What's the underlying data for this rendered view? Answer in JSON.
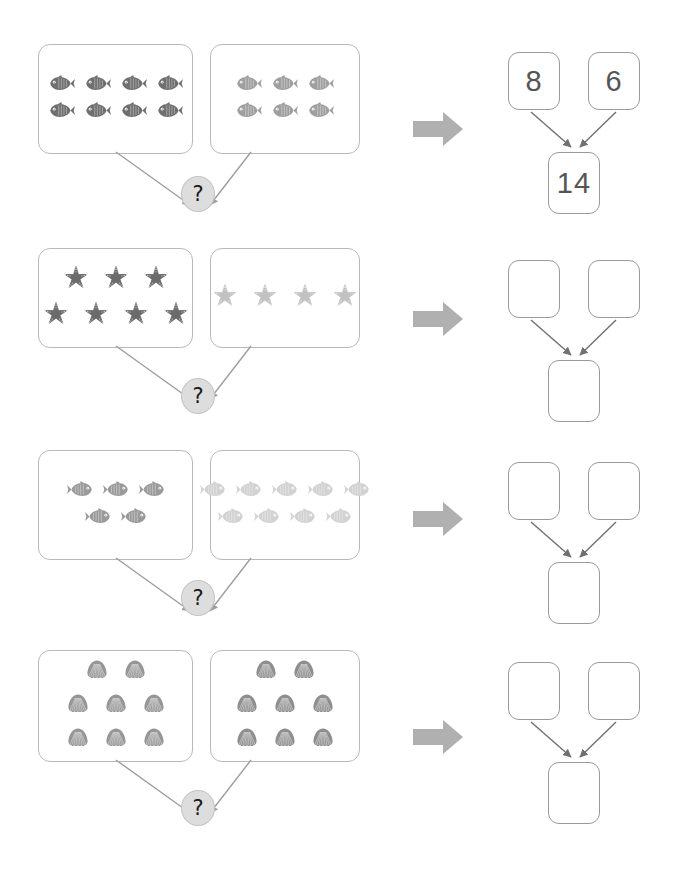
{
  "page": {
    "clipped_header_text": "· · ·· ·   ··  ·· ·  ·",
    "question_symbol": "?",
    "arrow_icon": "right-arrow-icon",
    "colors": {
      "box_border": "#b9b9b9",
      "bond_border": "#9a9a9a",
      "arrow_gray": "#a6a6a6",
      "qmark_fill": "#dddddd",
      "line_gray": "#9e9e9e"
    }
  },
  "rows": [
    {
      "id": "row-1",
      "left_group": {
        "icon": "fish-icon",
        "count": 8,
        "color": "#6f6f6f",
        "layout": [
          4,
          4
        ],
        "direction": "left"
      },
      "right_group": {
        "icon": "fish-icon",
        "count": 6,
        "color": "#9f9f9f",
        "layout": [
          3,
          3
        ],
        "direction": "left"
      },
      "bond": {
        "part_a": "8",
        "part_b": "6",
        "total": "14",
        "filled": true
      }
    },
    {
      "id": "row-2",
      "left_group": {
        "icon": "starfish-icon",
        "count": 7,
        "color": "#6b6b6b",
        "layout": [
          3,
          4
        ],
        "direction": "none"
      },
      "right_group": {
        "icon": "starfish-icon",
        "count": 4,
        "color": "#c2c2c2",
        "layout": [
          4
        ],
        "direction": "none"
      },
      "bond": {
        "part_a": "",
        "part_b": "",
        "total": "",
        "filled": false
      }
    },
    {
      "id": "row-3",
      "left_group": {
        "icon": "fish-icon",
        "count": 5,
        "color": "#9a9a9a",
        "layout": [
          3,
          2
        ],
        "direction": "right"
      },
      "right_group": {
        "icon": "fish-icon",
        "count": 9,
        "color": "#d2d2d2",
        "layout": [
          5,
          4
        ],
        "direction": "right"
      },
      "bond": {
        "part_a": "",
        "part_b": "",
        "total": "",
        "filled": false
      }
    },
    {
      "id": "row-4",
      "left_group": {
        "icon": "shell-icon",
        "count": 8,
        "color": "#969696",
        "layout": [
          2,
          3,
          3
        ],
        "direction": "none"
      },
      "right_group": {
        "icon": "shell-icon",
        "count": 8,
        "color": "#8e8e8e",
        "layout": [
          2,
          3,
          3
        ],
        "direction": "none"
      },
      "bond": {
        "part_a": "",
        "part_b": "",
        "total": "",
        "filled": false
      }
    }
  ]
}
